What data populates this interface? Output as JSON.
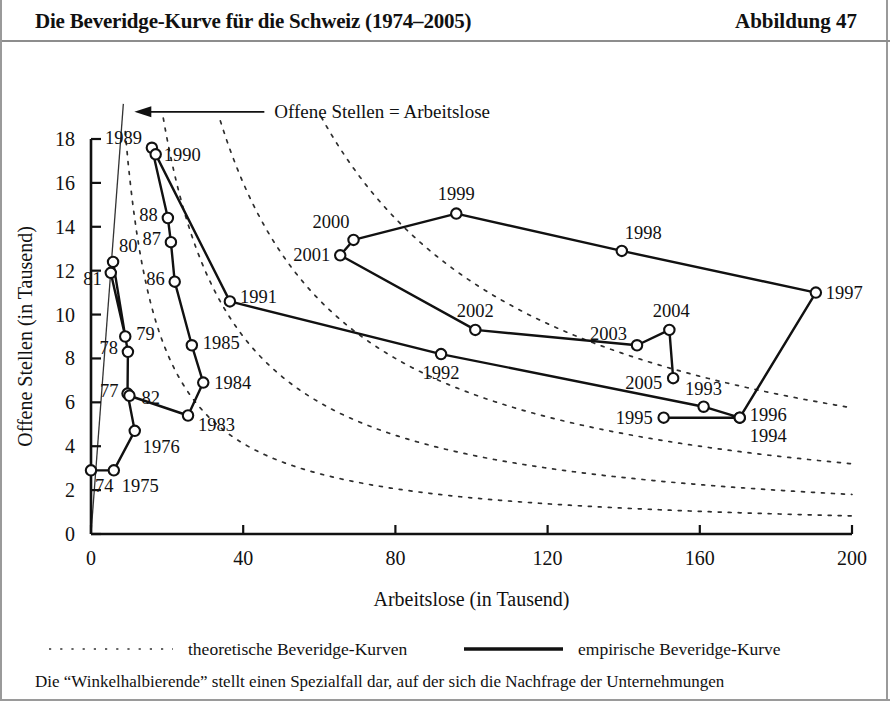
{
  "header": {
    "title": "Die Beveridge-Kurve für die Schweiz (1974–2005)",
    "figure_number": "Abbildung 47"
  },
  "legend": {
    "theoretical_label": "theoretische Beveridge-Kurven",
    "empirical_label": "empirische Beveridge-Kurve"
  },
  "caption": {
    "text": "Die “Winkelhalbierende” stellt einen Spezialfall dar, auf der sich die Nachfrage der Unternehmungen"
  },
  "colors": {
    "ink": "#111111",
    "frame": "#9a9a9a",
    "background": "#ffffff",
    "marker_fill": "#ffffff"
  },
  "chart_data": {
    "type": "scatter",
    "title": "Die Beveridge-Kurve für die Schweiz (1974–2005)",
    "xlabel": "Arbeitslose (in Tausend)",
    "ylabel": "Offene Stellen (in Tausend)",
    "xlim": [
      0,
      200
    ],
    "ylim": [
      0,
      18
    ],
    "xticks": [
      0,
      40,
      80,
      120,
      160,
      200
    ],
    "yticks": [
      0,
      2,
      4,
      6,
      8,
      10,
      12,
      14,
      16,
      18
    ],
    "grid": false,
    "legend_position": "below",
    "annotations": [
      {
        "text": "Offene Stellen = Arbeitslose",
        "target_x": 8.5,
        "target_y": 17.6
      }
    ],
    "series": [
      {
        "name": "empirische Beveridge-Kurve",
        "style": "solid-with-open-circles",
        "points": [
          {
            "label": "74",
            "x": 0.0,
            "y": 2.9
          },
          {
            "label": "1975",
            "x": 6.0,
            "y": 2.9
          },
          {
            "label": "1976",
            "x": 11.5,
            "y": 4.7
          },
          {
            "label": "77",
            "x": 9.6,
            "y": 6.4
          },
          {
            "label": "82",
            "x": 10.1,
            "y": 6.3
          },
          {
            "label": "78",
            "x": 9.7,
            "y": 8.3
          },
          {
            "label": "79",
            "x": 9.0,
            "y": 9.0
          },
          {
            "label": "80",
            "x": 5.8,
            "y": 12.4
          },
          {
            "label": "81",
            "x": 5.2,
            "y": 11.9
          },
          {
            "label": "1983",
            "x": 25.5,
            "y": 5.4
          },
          {
            "label": "1984",
            "x": 29.5,
            "y": 6.9
          },
          {
            "label": "1985",
            "x": 26.5,
            "y": 8.6
          },
          {
            "label": "86",
            "x": 22.0,
            "y": 11.5
          },
          {
            "label": "87",
            "x": 21.0,
            "y": 13.3
          },
          {
            "label": "88",
            "x": 20.2,
            "y": 14.4
          },
          {
            "label": "1989",
            "x": 16.0,
            "y": 17.6
          },
          {
            "label": "1990",
            "x": 17.0,
            "y": 17.3
          },
          {
            "label": "1991",
            "x": 36.5,
            "y": 10.6
          },
          {
            "label": "1992",
            "x": 92.0,
            "y": 8.2
          },
          {
            "label": "1993",
            "x": 161.0,
            "y": 5.8
          },
          {
            "label": "1994",
            "x": 170.5,
            "y": 5.3
          },
          {
            "label": "1995",
            "x": 150.5,
            "y": 5.3
          },
          {
            "label": "1996",
            "x": 170.5,
            "y": 5.3
          },
          {
            "label": "1997",
            "x": 190.5,
            "y": 11.0
          },
          {
            "label": "1998",
            "x": 139.5,
            "y": 12.9
          },
          {
            "label": "1999",
            "x": 96.0,
            "y": 14.6
          },
          {
            "label": "2000",
            "x": 69.0,
            "y": 13.4
          },
          {
            "label": "2001",
            "x": 65.5,
            "y": 12.7
          },
          {
            "label": "2002",
            "x": 101.0,
            "y": 9.3
          },
          {
            "label": "2003",
            "x": 143.5,
            "y": 8.6
          },
          {
            "label": "2004",
            "x": 152.0,
            "y": 9.3
          },
          {
            "label": "2005",
            "x": 153.0,
            "y": 7.1
          }
        ],
        "path_order": [
          "74",
          "1975",
          "1976",
          "77",
          "78",
          "79",
          "81",
          "80",
          "79",
          "78",
          "77",
          "82",
          "1983",
          "1984",
          "1985",
          "86",
          "87",
          "88",
          "1989",
          "1990",
          "1991",
          "1992",
          "1993",
          "1994",
          "1995",
          "1996",
          "1997",
          "1998",
          "1999",
          "2000",
          "2001",
          "2002",
          "2003",
          "2004",
          "2005"
        ]
      },
      {
        "name": "theoretische Beveridge-Kurven",
        "style": "dashed",
        "curves": [
          {
            "k": 165,
            "x0": 9.0,
            "x1": 200
          },
          {
            "k": 360,
            "x0": 19.0,
            "x1": 200
          },
          {
            "k": 640,
            "x0": 34.0,
            "x1": 200
          },
          {
            "k": 1150,
            "x0": 60.0,
            "x1": 200
          }
        ]
      },
      {
        "name": "Winkelhalbierende",
        "style": "thin-solid",
        "points": [
          {
            "x": 0,
            "y": 0
          },
          {
            "x": 8.5,
            "y": 19.6
          }
        ]
      }
    ]
  },
  "axis_labels": {
    "x": "Arbeitslose (in Tausend)",
    "y": "Offene Stellen (in Tausend)"
  }
}
